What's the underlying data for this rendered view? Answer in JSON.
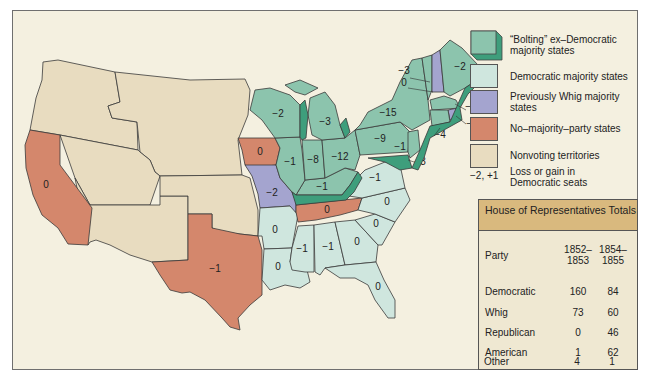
{
  "legend": {
    "items": [
      {
        "key": "bolting",
        "label": "“Bolting” ex–Democratic majority states",
        "color": "#8cc4ad",
        "edge_color": "#3e9e7c"
      },
      {
        "key": "democratic",
        "label": "Democratic majority states",
        "color": "#cfe6de"
      },
      {
        "key": "whig",
        "label": "Previously Whig majority states",
        "color": "#a4a4cf"
      },
      {
        "key": "no_majority",
        "label": "No–majority–party states",
        "color": "#d4876c"
      },
      {
        "key": "nonvoting",
        "label": "Nonvoting territories",
        "color": "#e8dcc0"
      }
    ],
    "seat_change_sample": "−2, +1",
    "seat_change_label": "Loss or gain in Democratic seats"
  },
  "table": {
    "title": "House of Representatives Totals",
    "headers": [
      "Party",
      "1852– 1853",
      "1854– 1855"
    ],
    "header_col1_l1": "1852–",
    "header_col1_l2": "1853",
    "header_col2_l1": "1854–",
    "header_col2_l2": "1855",
    "rows": [
      {
        "party": "Democratic",
        "y1852": "160",
        "y1854": "84"
      },
      {
        "party": "Whig",
        "y1852": "73",
        "y1854": "60"
      },
      {
        "party": "Republican",
        "y1852": "0",
        "y1854": "46"
      },
      {
        "party": "American",
        "y1852": "1",
        "y1854": "62"
      },
      {
        "party": "Other",
        "y1852": "4",
        "y1854": "1"
      }
    ]
  },
  "map": {
    "labels": {
      "california": "0",
      "texas": "−1",
      "iowa": "0",
      "missouri": "−2",
      "arkansas": "0",
      "louisiana": "0",
      "mississippi": "−1",
      "alabama": "−1",
      "georgia": "0",
      "florida": "0",
      "tennessee": "0",
      "south_carolina": "0",
      "north_carolina": "0",
      "virginia": "−1",
      "kentucky": "−1",
      "wisconsin": "−2",
      "illinois": "−1",
      "indiana": "−8",
      "michigan": "−3",
      "ohio": "−12",
      "pennsylvania": "−9",
      "new_york": "−15",
      "new_jersey": "−1",
      "maryland": "−3",
      "connecticut": "−4",
      "rhode_island": "−2",
      "massachusetts": "−2",
      "vermont": "−3",
      "new_hampshire": "0",
      "maine": "−2"
    }
  }
}
